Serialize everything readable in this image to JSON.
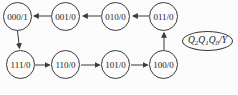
{
  "diagram": {
    "type": "state-transition-diagram",
    "states": [
      "000/1",
      "001/0",
      "010/0",
      "011/0",
      "111/0",
      "110/0",
      "101/0",
      "100/0"
    ],
    "transitions": [
      {
        "from": "000",
        "to": "111",
        "direction": "down"
      },
      {
        "from": "111",
        "to": "110",
        "direction": "right"
      },
      {
        "from": "110",
        "to": "101",
        "direction": "right"
      },
      {
        "from": "101",
        "to": "100",
        "direction": "right"
      },
      {
        "from": "100",
        "to": "011",
        "direction": "up"
      },
      {
        "from": "011",
        "to": "010",
        "direction": "left"
      },
      {
        "from": "010",
        "to": "001",
        "direction": "left"
      },
      {
        "from": "001",
        "to": "000",
        "direction": "left"
      }
    ],
    "legend": {
      "q": "Q",
      "sub2": "2",
      "sub1": "1",
      "sub0": "0",
      "suffix": "/Y"
    }
  },
  "colors": {
    "stroke": "#3b3b3b",
    "text": "#1b1b1b",
    "background": "#fcfcfc"
  }
}
